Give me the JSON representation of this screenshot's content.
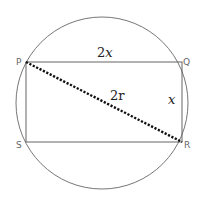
{
  "diagram": {
    "circle": {
      "cx": 102,
      "cy": 103,
      "r": 86
    },
    "vertices": [
      {
        "label": "P",
        "x": 26,
        "y": 62
      },
      {
        "label": "Q",
        "x": 182,
        "y": 62
      },
      {
        "label": "R",
        "x": 182,
        "y": 142
      },
      {
        "label": "S",
        "x": 26,
        "y": 142
      }
    ],
    "edge_labels": {
      "top": "2x",
      "right": "x",
      "diagonal": "2r"
    },
    "top_coef": "2",
    "top_var": "x",
    "right_var": "x",
    "diag_text": "2r",
    "colors": {
      "outline": "#555555",
      "diagonal": "#111111",
      "text": "#222222"
    }
  }
}
